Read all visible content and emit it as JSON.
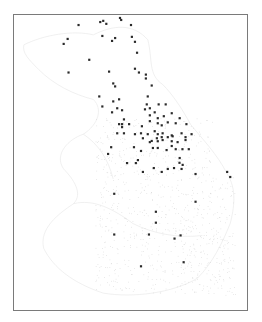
{
  "map": {
    "title": "",
    "faint_label": "",
    "coastline_color": "#e6e6e6",
    "stipple_color": "#d4d4d4",
    "marker_color": "#2a2a2a",
    "border_color": "#7a7a7a",
    "points": [
      [
        0.277,
        0.034
      ],
      [
        0.37,
        0.024
      ],
      [
        0.383,
        0.02
      ],
      [
        0.396,
        0.03
      ],
      [
        0.455,
        0.01
      ],
      [
        0.46,
        0.017
      ],
      [
        0.502,
        0.034
      ],
      [
        0.23,
        0.081
      ],
      [
        0.213,
        0.098
      ],
      [
        0.379,
        0.071
      ],
      [
        0.421,
        0.088
      ],
      [
        0.434,
        0.078
      ],
      [
        0.506,
        0.074
      ],
      [
        0.519,
        0.091
      ],
      [
        0.528,
        0.128
      ],
      [
        0.323,
        0.152
      ],
      [
        0.234,
        0.195
      ],
      [
        0.408,
        0.192
      ],
      [
        0.519,
        0.182
      ],
      [
        0.536,
        0.195
      ],
      [
        0.566,
        0.202
      ],
      [
        0.566,
        0.215
      ],
      [
        0.591,
        0.239
      ],
      [
        0.426,
        0.232
      ],
      [
        0.434,
        0.242
      ],
      [
        0.366,
        0.276
      ],
      [
        0.426,
        0.293
      ],
      [
        0.451,
        0.286
      ],
      [
        0.379,
        0.31
      ],
      [
        0.443,
        0.316
      ],
      [
        0.574,
        0.276
      ],
      [
        0.57,
        0.303
      ],
      [
        0.562,
        0.32
      ],
      [
        0.583,
        0.316
      ],
      [
        0.621,
        0.303
      ],
      [
        0.651,
        0.303
      ],
      [
        0.421,
        0.33
      ],
      [
        0.464,
        0.323
      ],
      [
        0.583,
        0.34
      ],
      [
        0.604,
        0.33
      ],
      [
        0.617,
        0.35
      ],
      [
        0.643,
        0.343
      ],
      [
        0.677,
        0.333
      ],
      [
        0.472,
        0.354
      ],
      [
        0.451,
        0.37
      ],
      [
        0.464,
        0.37
      ],
      [
        0.464,
        0.38
      ],
      [
        0.494,
        0.37
      ],
      [
        0.549,
        0.377
      ],
      [
        0.583,
        0.36
      ],
      [
        0.617,
        0.367
      ],
      [
        0.634,
        0.374
      ],
      [
        0.66,
        0.364
      ],
      [
        0.711,
        0.35
      ],
      [
        0.694,
        0.367
      ],
      [
        0.74,
        0.37
      ],
      [
        0.443,
        0.401
      ],
      [
        0.472,
        0.401
      ],
      [
        0.545,
        0.401
      ],
      [
        0.519,
        0.404
      ],
      [
        0.574,
        0.404
      ],
      [
        0.604,
        0.394
      ],
      [
        0.617,
        0.404
      ],
      [
        0.638,
        0.401
      ],
      [
        0.677,
        0.408
      ],
      [
        0.719,
        0.401
      ],
      [
        0.762,
        0.404
      ],
      [
        0.553,
        0.418
      ],
      [
        0.591,
        0.427
      ],
      [
        0.613,
        0.418
      ],
      [
        0.634,
        0.414
      ],
      [
        0.66,
        0.414
      ],
      [
        0.681,
        0.411
      ],
      [
        0.736,
        0.414
      ],
      [
        0.736,
        0.424
      ],
      [
        0.583,
        0.431
      ],
      [
        0.617,
        0.428
      ],
      [
        0.638,
        0.424
      ],
      [
        0.677,
        0.428
      ],
      [
        0.702,
        0.431
      ],
      [
        0.596,
        0.451
      ],
      [
        0.617,
        0.451
      ],
      [
        0.655,
        0.458
      ],
      [
        0.677,
        0.444
      ],
      [
        0.694,
        0.455
      ],
      [
        0.723,
        0.455
      ],
      [
        0.75,
        0.455
      ],
      [
        0.417,
        0.448
      ],
      [
        0.404,
        0.471
      ],
      [
        0.515,
        0.448
      ],
      [
        0.545,
        0.461
      ],
      [
        0.532,
        0.492
      ],
      [
        0.523,
        0.502
      ],
      [
        0.485,
        0.502
      ],
      [
        0.553,
        0.532
      ],
      [
        0.711,
        0.485
      ],
      [
        0.71,
        0.501
      ],
      [
        0.724,
        0.508
      ],
      [
        0.6,
        0.519
      ],
      [
        0.634,
        0.532
      ],
      [
        0.66,
        0.522
      ],
      [
        0.687,
        0.519
      ],
      [
        0.719,
        0.522
      ],
      [
        0.779,
        0.539
      ],
      [
        0.915,
        0.532
      ],
      [
        0.928,
        0.549
      ],
      [
        0.43,
        0.606
      ],
      [
        0.779,
        0.633
      ],
      [
        0.609,
        0.667
      ],
      [
        0.609,
        0.704
      ],
      [
        0.43,
        0.744
      ],
      [
        0.579,
        0.744
      ],
      [
        0.689,
        0.758
      ],
      [
        0.715,
        0.747
      ],
      [
        0.728,
        0.838
      ],
      [
        0.545,
        0.852
      ]
    ]
  }
}
